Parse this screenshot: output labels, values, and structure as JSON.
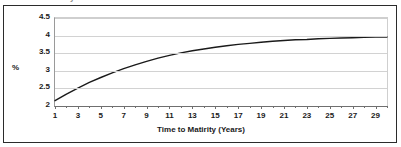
{
  "figure": {
    "clipped_top_text": "y",
    "border_color": "#2b2b2b",
    "background": "#ffffff"
  },
  "chart_data": {
    "type": "line",
    "title": "",
    "xlabel": "Time to Matirity (Years)",
    "ylabel": "%",
    "xlim": [
      1,
      30
    ],
    "ylim": [
      2,
      4.5
    ],
    "grid": true,
    "legend": false,
    "line_color": "#1a1a1a",
    "yticks": [
      2,
      2.5,
      3,
      3.5,
      4,
      4.5
    ],
    "ytick_labels": [
      "2",
      "2.5",
      "3",
      "3.5",
      "4",
      "4.5"
    ],
    "xticks": [
      1,
      3,
      5,
      7,
      9,
      11,
      13,
      15,
      17,
      19,
      21,
      23,
      25,
      27,
      29
    ],
    "xtick_labels": [
      "1",
      "3",
      "5",
      "7",
      "9",
      "11",
      "13",
      "15",
      "17",
      "19",
      "21",
      "23",
      "25",
      "27",
      "29"
    ],
    "x": [
      1,
      2,
      3,
      4,
      5,
      6,
      7,
      8,
      9,
      10,
      11,
      12,
      13,
      14,
      15,
      16,
      17,
      18,
      19,
      20,
      21,
      22,
      23,
      24,
      25,
      26,
      27,
      28,
      29,
      30
    ],
    "values": [
      2.15,
      2.34,
      2.51,
      2.67,
      2.81,
      2.94,
      3.06,
      3.17,
      3.27,
      3.36,
      3.44,
      3.51,
      3.57,
      3.62,
      3.67,
      3.71,
      3.75,
      3.78,
      3.81,
      3.84,
      3.86,
      3.88,
      3.89,
      3.91,
      3.92,
      3.93,
      3.94,
      3.95,
      3.96,
      3.96
    ],
    "series": [
      {
        "name": "Yield",
        "values": [
          2.15,
          2.34,
          2.51,
          2.67,
          2.81,
          2.94,
          3.06,
          3.17,
          3.27,
          3.36,
          3.44,
          3.51,
          3.57,
          3.62,
          3.67,
          3.71,
          3.75,
          3.78,
          3.81,
          3.84,
          3.86,
          3.88,
          3.89,
          3.91,
          3.92,
          3.93,
          3.94,
          3.95,
          3.96,
          3.96
        ]
      }
    ]
  }
}
